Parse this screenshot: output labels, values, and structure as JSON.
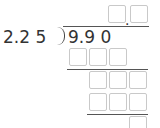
{
  "problem": {
    "divisor": "2.2 5",
    "dividend": "9.9 0",
    "quotient_separator": "."
  },
  "quotient_boxes": [
    "",
    ""
  ],
  "work_rows": [
    {
      "boxes": [
        "",
        "",
        ""
      ]
    },
    {
      "boxes": [
        "",
        "",
        ""
      ]
    },
    {
      "boxes": [
        "",
        "",
        ""
      ]
    },
    {
      "boxes": [
        ""
      ]
    }
  ]
}
